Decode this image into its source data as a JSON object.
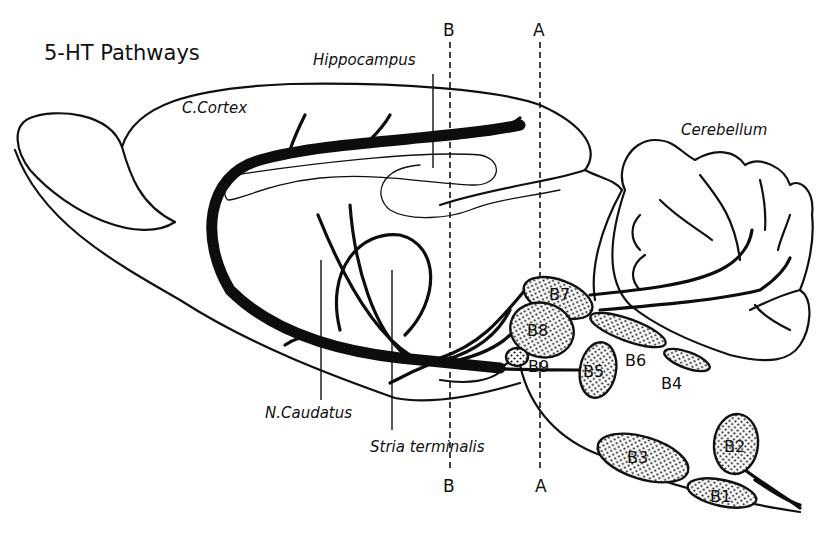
{
  "figure": {
    "title": "5-HT Pathways",
    "background": "#ffffff",
    "ink": "#111111"
  },
  "regions": {
    "cortex": "C.Cortex",
    "hippocampus": "Hippocampus",
    "cerebellum": "Cerebellum",
    "caudatus": "N.Caudatus",
    "stria": "Stria terminalis"
  },
  "section_lines": {
    "B_top": "B",
    "B_bottom": "B",
    "A_top": "A",
    "A_bottom": "A"
  },
  "nuclei": {
    "B1": "B1",
    "B2": "B2",
    "B3": "B3",
    "B4": "B4",
    "B5": "B5",
    "B6": "B6",
    "B7": "B7",
    "B8": "B8",
    "B9": "B9"
  }
}
